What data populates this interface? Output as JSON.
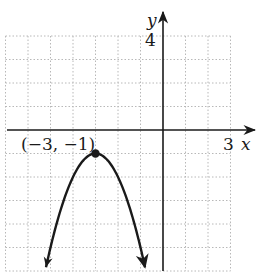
{
  "chart_data": {
    "type": "line",
    "title": "",
    "function": "f(x) = -(x + 3)^2 - 1",
    "xlabel": "x",
    "ylabel": "y",
    "xlim": [
      -7,
      3
    ],
    "ylim": [
      -6,
      4
    ],
    "grid": true,
    "grid_style": "dotted",
    "x_tick_labels": [
      {
        "value": 3,
        "label": "3"
      }
    ],
    "y_tick_labels": [
      {
        "value": 4,
        "label": "4"
      }
    ],
    "series": [
      {
        "name": "parabola",
        "shape": "downward-opening parabola",
        "vertex": [
          -3,
          -1
        ],
        "arrows_at_ends": true,
        "x": [
          -5.2,
          -5,
          -4,
          -3,
          -2,
          -1,
          -0.8
        ],
        "y": [
          -5.84,
          -5,
          -2,
          -1,
          -2,
          -5,
          -5.84
        ]
      }
    ],
    "annotations": [
      {
        "text": "(−3, −1)",
        "at": [
          -3,
          -1
        ],
        "marker": "filled-dot"
      }
    ]
  },
  "labels": {
    "x_axis": "x",
    "y_axis": "y",
    "x_tick": "3",
    "y_tick": "4",
    "vertex": "(−3, −1)"
  },
  "colors": {
    "axis": "#1a1a1a",
    "curve": "#1a1a1a",
    "grid": "#b8b8b8",
    "background": "#ffffff"
  }
}
